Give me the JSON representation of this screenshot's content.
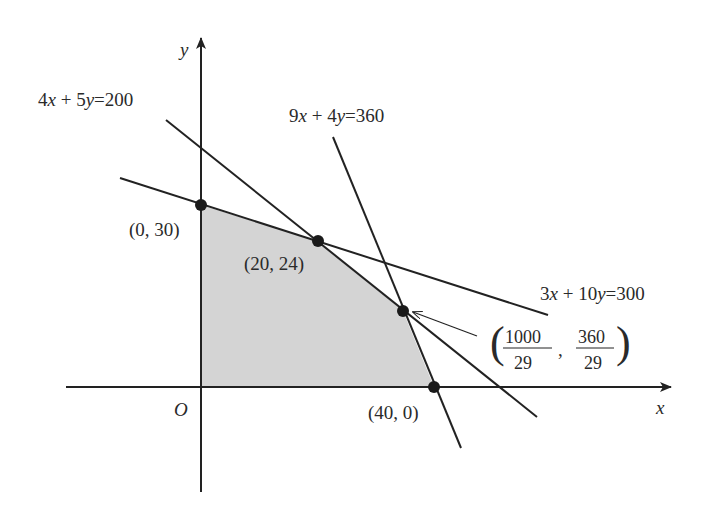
{
  "diagram": {
    "axes": {
      "x_label": "x",
      "y_label": "y",
      "origin_label": "O"
    },
    "constraints": [
      {
        "id": "c1",
        "label": "4x + 5y = 200",
        "lhs_a": 4,
        "lhs_b": 5,
        "rhs": 200
      },
      {
        "id": "c2",
        "label": "9x + 4y = 360",
        "lhs_a": 9,
        "lhs_b": 4,
        "rhs": 360
      },
      {
        "id": "c3",
        "label": "3x + 10y = 300",
        "lhs_a": 3,
        "lhs_b": 10,
        "rhs": 300
      }
    ],
    "vertices": [
      {
        "label": "(0, 30)",
        "x": 0,
        "y": 30
      },
      {
        "label": "(20, 24)",
        "x": 20,
        "y": 24
      },
      {
        "label": "(1000/29, 360/29)",
        "x_num": "1000",
        "x_den": "29",
        "y_num": "360",
        "y_den": "29"
      },
      {
        "label": "(40, 0)",
        "x": 40,
        "y": 0
      },
      {
        "label": "O",
        "x": 0,
        "y": 0
      }
    ],
    "labels": {
      "c1_a": "4",
      "c1_x": "x",
      "c1_plus": " + 5",
      "c1_y": "y",
      "c1_rhs": "=200",
      "c2_a": "9",
      "c2_x": "x",
      "c2_plus": " + 4",
      "c2_y": "y",
      "c2_rhs": "=360",
      "c3_a": "3",
      "c3_x": "x",
      "c3_plus": " + 10",
      "c3_y": "y",
      "c3_rhs": "=300",
      "p1": "(0, 30)",
      "p2": "(20, 24)",
      "p4": "(40, 0)",
      "frac_x_num": "1000",
      "frac_x_den": "29",
      "frac_y_num": "360",
      "frac_y_den": "29",
      "comma": ","
    },
    "colors": {
      "ink": "#222222",
      "region_fill": "#d4d4d4"
    }
  }
}
